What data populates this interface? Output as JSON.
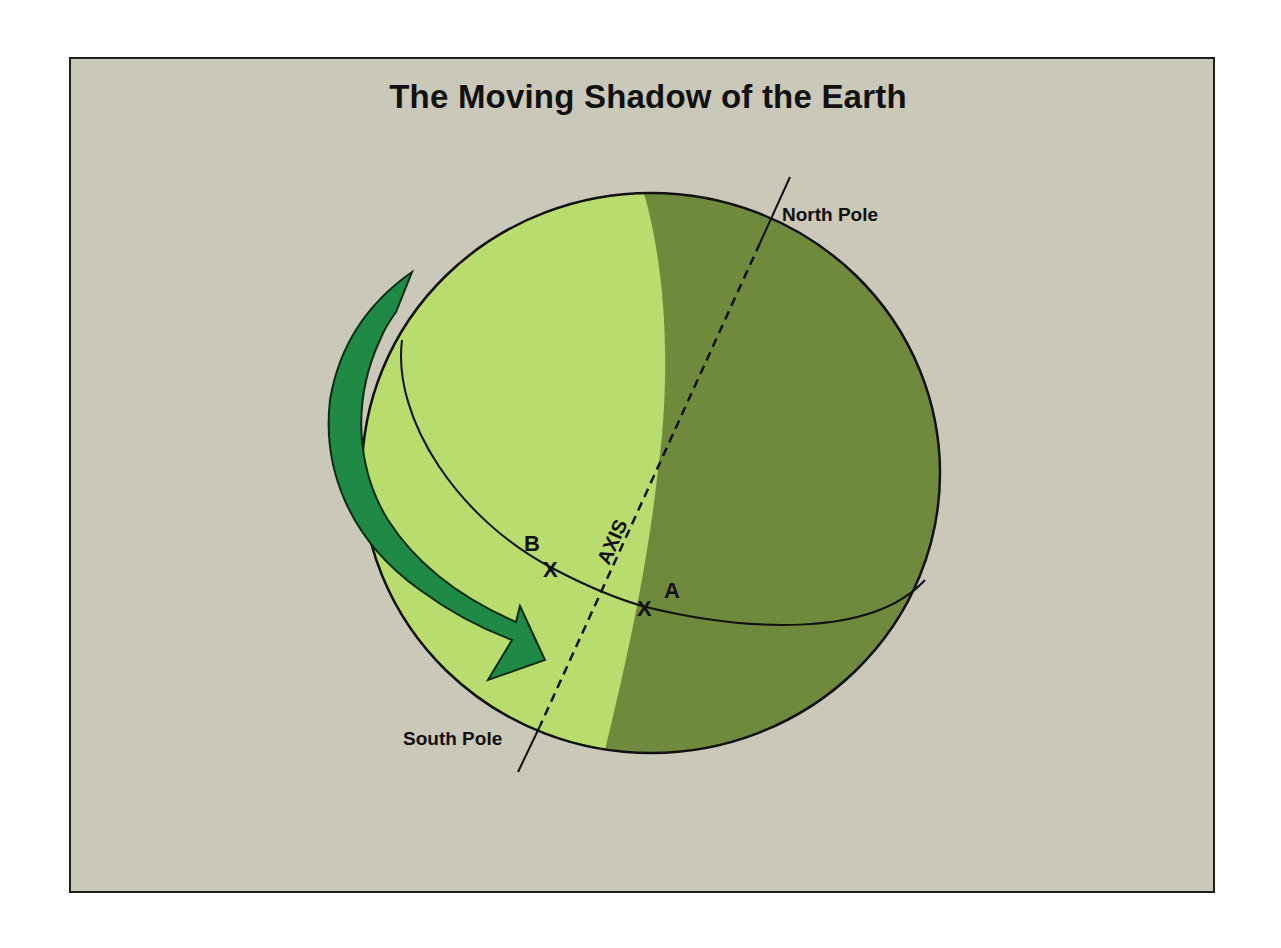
{
  "title": "The Moving Shadow of the Earth",
  "labels": {
    "north_pole": "North Pole",
    "south_pole": "South Pole",
    "axis": "AXIS",
    "point_a": "A",
    "point_b": "B",
    "mark_a": "X",
    "mark_b": "X"
  },
  "colors": {
    "background": "#cac8b8",
    "frame_border": "#1f1f1a",
    "day_side": "#b8dd6e",
    "night_side": "#6f8a3c",
    "arrow": "#1f8a45",
    "outline": "#111111"
  },
  "legend_semantics": {
    "day_side": "sunlit hemisphere (light green)",
    "night_side": "shadow hemisphere (dark green)",
    "arrow": "direction of Earth's rotation"
  }
}
